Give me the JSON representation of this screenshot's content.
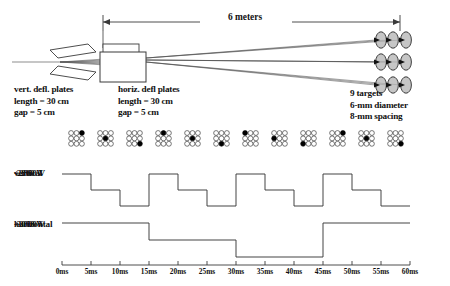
{
  "diagram": {
    "title_dimension": "6 meters",
    "left_plates": {
      "name": "vert. defl. plates",
      "length": "length = 30 cm",
      "gap": "gap = 5 cm"
    },
    "mid_plates": {
      "name": "horiz. defl plates",
      "length": "length = 30 cm",
      "gap": "gap = 5 cm"
    },
    "targets": {
      "count_label": "9 targets",
      "diameter": "6-mm diameter",
      "spacing": "8-mm spacing",
      "rows": 3,
      "cols": 3
    }
  },
  "target_states": [
    {
      "time": "0ms",
      "row": 0,
      "col": 2
    },
    {
      "time": "5ms",
      "row": 1,
      "col": 1
    },
    {
      "time": "10ms",
      "row": 2,
      "col": 2
    },
    {
      "time": "15ms",
      "row": 0,
      "col": 1
    },
    {
      "time": "20ms",
      "row": 1,
      "col": 1
    },
    {
      "time": "25ms",
      "row": 2,
      "col": 1
    },
    {
      "time": "30ms",
      "row": 0,
      "col": 0
    },
    {
      "time": "35ms",
      "row": 1,
      "col": 0
    },
    {
      "time": "40ms",
      "row": 2,
      "col": 0
    },
    {
      "time": "45ms",
      "row": 0,
      "col": 2
    },
    {
      "time": "50ms",
      "row": 1,
      "col": 1
    },
    {
      "time": "55ms",
      "row": 2,
      "col": 2
    }
  ],
  "vertical_trace": {
    "label_top": "+2800 V",
    "label_mid": "vertical",
    "label_bot": "-2800 V",
    "levels": [
      1,
      0,
      -1,
      1,
      0,
      -1,
      1,
      0,
      -1,
      1,
      0,
      -1
    ],
    "step_ms": 5
  },
  "horizontal_trace": {
    "label_top": "+3000 V",
    "label_mid": "horizontal",
    "label_bot": "-3000 V",
    "levels": [
      1,
      0,
      -1,
      1
    ],
    "step_ms": 15
  },
  "time_axis": {
    "ticks": [
      "0ms",
      "5ms",
      "10ms",
      "15ms",
      "20ms",
      "25ms",
      "30ms",
      "35ms",
      "40ms",
      "45ms",
      "50ms",
      "55ms",
      "60ms"
    ],
    "min_ms": 0,
    "max_ms": 60,
    "step_ms": 5
  },
  "chart_data": {
    "type": "line",
    "xlabel": "time (ms)",
    "xlim": [
      0,
      60
    ],
    "grid": false,
    "legend": "none",
    "x": [
      0,
      5,
      10,
      15,
      20,
      25,
      30,
      35,
      40,
      45,
      50,
      55,
      60
    ],
    "series": [
      {
        "name": "vertical",
        "ylabel": "+2800 V / -2800 V",
        "ylim": [
          -2800,
          2800
        ],
        "step": "post",
        "values": [
          2800,
          0,
          -2800,
          2800,
          0,
          -2800,
          2800,
          0,
          -2800,
          2800,
          0,
          -2800,
          -2800
        ]
      },
      {
        "name": "horizontal",
        "ylabel": "+3000 V / -3000 V",
        "ylim": [
          -3000,
          3000
        ],
        "step": "post",
        "values": [
          3000,
          3000,
          3000,
          0,
          0,
          0,
          -3000,
          -3000,
          -3000,
          3000,
          3000,
          3000,
          3000
        ]
      }
    ]
  },
  "colors": {
    "ink": "#111111",
    "line": "#3a3a3a",
    "target_fill": "#b3b3b3",
    "dot_on": "#000000",
    "dot_off": "#ffffff"
  }
}
